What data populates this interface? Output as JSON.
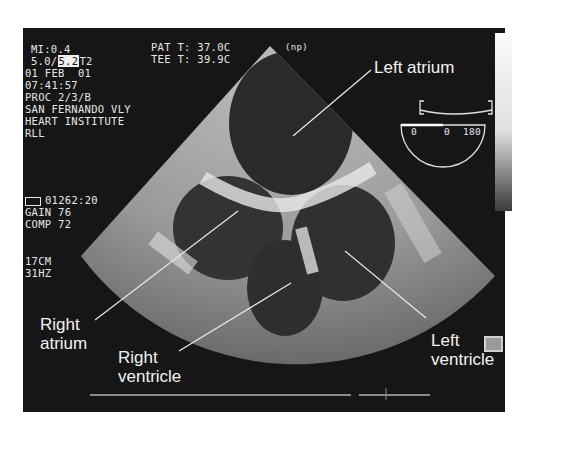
{
  "info_left": {
    "mi": "MI:0.4",
    "freq_prefix": "5.0/",
    "freq_highlight": "5.2",
    "freq_suffix": "T2",
    "date": "01 FEB  01",
    "time": "07:41:57",
    "proc": "PROC 2/3/B",
    "site_line1": "SAN FERNANDO VLY",
    "site_line2": "HEART INSTITUTE",
    "code": "RLL"
  },
  "info_temp": {
    "pat_t": "PAT T: 37.0C",
    "tee_t": "TEE T: 39.9C"
  },
  "probe_mark": "(np)",
  "counter": {
    "icon": "tape-icon",
    "value": "01262:20"
  },
  "settings": {
    "gain": "GAIN 76",
    "comp": "COMP 72",
    "depth": "17CM",
    "rate": "31HZ"
  },
  "angle_indicator": {
    "left": "0",
    "mid": "0",
    "right": "180",
    "angle_deg": 0
  },
  "labels": {
    "left_atrium": "Left atrium",
    "right_atrium_1": "Right",
    "right_atrium_2": "atrium",
    "right_ventricle_1": "Right",
    "right_ventricle_2": "ventricle",
    "left_ventricle": "Left ventricle"
  },
  "colors": {
    "background": "#161616",
    "text": "#e6e6e6"
  }
}
